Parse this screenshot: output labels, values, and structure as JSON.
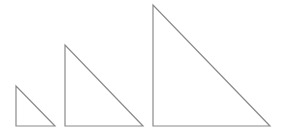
{
  "diagram": {
    "stroke_color": "#8a8a8a",
    "background": "#ffffff",
    "triangles": [
      {
        "name": "small",
        "points": "16,86 16,126 55,126"
      },
      {
        "name": "medium",
        "points": "65,45 65,126 143,126"
      },
      {
        "name": "large",
        "points": "153,5 153,126 270,126"
      }
    ]
  }
}
